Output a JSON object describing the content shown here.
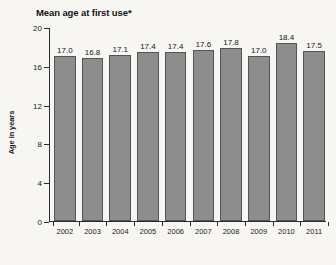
{
  "chart_data": {
    "type": "bar",
    "title": "Mean age at first use*",
    "xlabel": "",
    "ylabel": "Age in years",
    "categories": [
      "2002",
      "2003",
      "2004",
      "2005",
      "2006",
      "2007",
      "2008",
      "2009",
      "2010",
      "2011"
    ],
    "values": [
      17.0,
      16.8,
      17.1,
      17.4,
      17.4,
      17.6,
      17.8,
      17.0,
      18.4,
      17.5
    ],
    "value_labels": [
      "17.0",
      "16.8",
      "17.1",
      "17.4",
      "17.4",
      "17.6",
      "17.8",
      "17.0",
      "18.4",
      "17.5"
    ],
    "ylim": [
      0,
      20
    ],
    "yticks": [
      0,
      4,
      8,
      12,
      16,
      20
    ],
    "ytick_labels": [
      "0",
      "4",
      "8",
      "12",
      "16",
      "20"
    ],
    "grid": false,
    "legend": null,
    "colors": {
      "bar_fill": "#8d8d8d",
      "bar_border": "#545454",
      "axis": "#2b2b2b",
      "text": "#141414",
      "background": "#f7f6f3"
    }
  }
}
